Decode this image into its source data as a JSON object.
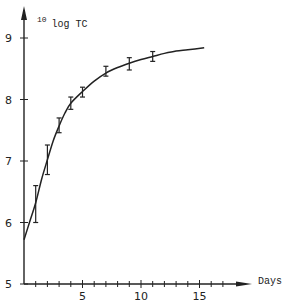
{
  "chart_data": {
    "type": "line",
    "title": "",
    "xlabel": "Days",
    "ylabel": "10log TC",
    "ylabel_parts": {
      "superscript": "10",
      "main": "log TC"
    },
    "xlim": [
      0,
      17.5
    ],
    "ylim": [
      5,
      9.3
    ],
    "x_ticks": [
      5,
      10,
      15
    ],
    "x_minor_step": 1,
    "y_ticks": [
      5,
      6,
      7,
      8,
      9
    ],
    "grid": false,
    "legend": null,
    "series": [
      {
        "name": "measured (mean ± error)",
        "kind": "errorbar",
        "points": [
          {
            "x": 1,
            "y": 6.32,
            "lo": 6.0,
            "hi": 6.6
          },
          {
            "x": 2,
            "y": 7.02,
            "lo": 6.78,
            "hi": 7.26
          },
          {
            "x": 3,
            "y": 7.57,
            "lo": 7.46,
            "hi": 7.7
          },
          {
            "x": 4,
            "y": 7.94,
            "lo": 7.84,
            "hi": 8.04
          },
          {
            "x": 5,
            "y": 8.12,
            "lo": 8.04,
            "hi": 8.2
          },
          {
            "x": 7,
            "y": 8.45,
            "lo": 8.38,
            "hi": 8.54
          },
          {
            "x": 9,
            "y": 8.58,
            "lo": 8.48,
            "hi": 8.68
          },
          {
            "x": 11,
            "y": 8.7,
            "lo": 8.62,
            "hi": 8.78
          }
        ]
      },
      {
        "name": "fitted curve",
        "kind": "line",
        "x": [
          0,
          0.5,
          1,
          1.5,
          2,
          2.5,
          3,
          3.5,
          4,
          5,
          6,
          7,
          8,
          9,
          10,
          11,
          12,
          13,
          14,
          15.4
        ],
        "y": [
          5.72,
          6.02,
          6.32,
          6.7,
          7.02,
          7.33,
          7.57,
          7.78,
          7.94,
          8.13,
          8.3,
          8.43,
          8.52,
          8.59,
          8.65,
          8.7,
          8.75,
          8.79,
          8.81,
          8.84
        ]
      }
    ]
  },
  "colors": {
    "ink": "#222222",
    "background": "#ffffff"
  }
}
